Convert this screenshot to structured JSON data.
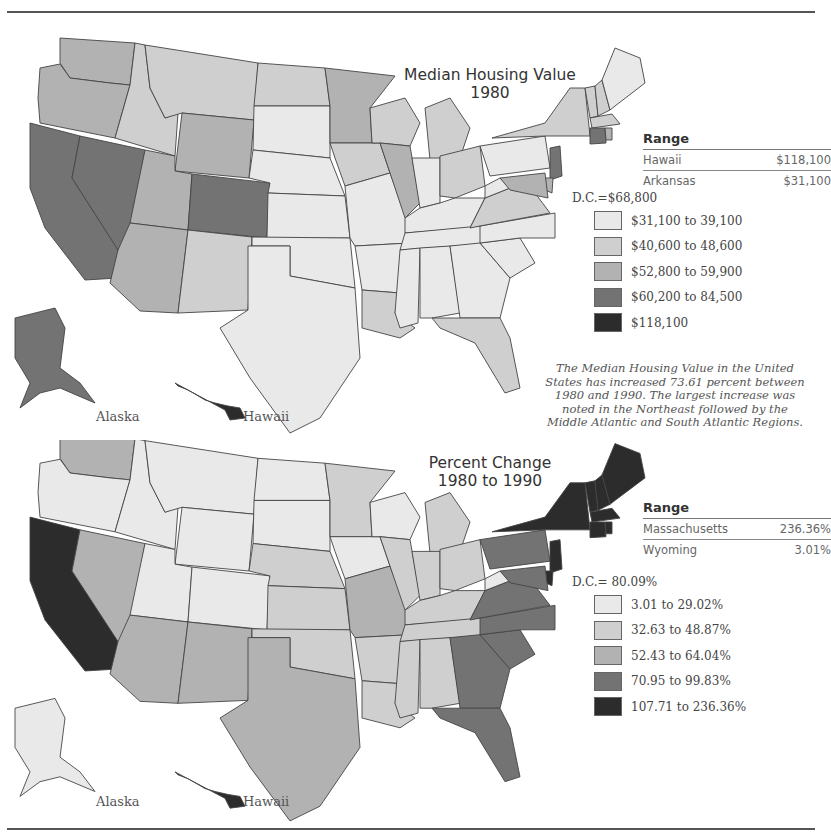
{
  "colors": {
    "c1": "#e9e9e9",
    "c2": "#cfcfcf",
    "c3": "#b2b2b2",
    "c4": "#737373",
    "c5": "#2c2c2c",
    "border": "#444444"
  },
  "map1": {
    "title_line1": "Median Housing Value",
    "title_line2": "1980",
    "range": {
      "header": "Range",
      "rows": [
        {
          "name": "Hawaii",
          "value": "$118,100"
        },
        {
          "name": "Arkansas",
          "value": "$31,100"
        }
      ]
    },
    "dc": "D.C.=$68,800",
    "legend": [
      {
        "label": "$31,100 to 39,100",
        "class": "c1"
      },
      {
        "label": "$40,600 to 48,600",
        "class": "c2"
      },
      {
        "label": "$52,800 to 59,900",
        "class": "c3"
      },
      {
        "label": "$60,200 to 84,500",
        "class": "c4"
      },
      {
        "label": "$118,100",
        "class": "c5"
      }
    ],
    "note": "The Median Housing Value in the United States has increased 73.61 percent between 1980 and 1990. The largest increase was noted in the Northeast followed by the Middle Atlantic and South Atlantic Regions.",
    "alaska_label": "Alaska",
    "hawaii_label": "Hawaii"
  },
  "map2": {
    "title_line1": "Percent Change",
    "title_line2": "1980 to 1990",
    "range": {
      "header": "Range",
      "rows": [
        {
          "name": "Massachusetts",
          "value": "236.36%"
        },
        {
          "name": "Wyoming",
          "value": "3.01%"
        }
      ]
    },
    "dc": "D.C.= 80.09%",
    "legend": [
      {
        "label": "3.01 to 29.02%",
        "class": "c1"
      },
      {
        "label": "32.63 to 48.87%",
        "class": "c2"
      },
      {
        "label": "52.43 to 64.04%",
        "class": "c3"
      },
      {
        "label": "70.95 to 99.83%",
        "class": "c4"
      },
      {
        "label": "107.71 to 236.36%",
        "class": "c5"
      }
    ],
    "alaska_label": "Alaska",
    "hawaii_label": "Hawaii"
  },
  "states_1980": {
    "WA": "c3",
    "OR": "c3",
    "CA": "c4",
    "NV": "c4",
    "ID": "c2",
    "MT": "c2",
    "WY": "c3",
    "UT": "c3",
    "CO": "c4",
    "AZ": "c3",
    "NM": "c2",
    "ND": "c2",
    "SD": "c1",
    "NE": "c1",
    "KS": "c1",
    "OK": "c1",
    "TX": "c1",
    "MN": "c3",
    "IA": "c2",
    "MO": "c1",
    "AR": "c1",
    "LA": "c2",
    "WI": "c2",
    "IL": "c3",
    "MI": "c2",
    "IN": "c1",
    "OH": "c2",
    "KY": "c1",
    "TN": "c1",
    "MS": "c1",
    "AL": "c1",
    "GA": "c1",
    "FL": "c2",
    "SC": "c1",
    "NC": "c1",
    "VA": "c2",
    "WV": "c1",
    "PA": "c1",
    "NY": "c2",
    "VT": "c2",
    "NH": "c2",
    "ME": "c1",
    "MA": "c2",
    "CT": "c4",
    "RI": "c3",
    "NJ": "c4",
    "DE": "c3",
    "MD": "c3",
    "AK": "c4",
    "HI": "c5"
  },
  "states_change": {
    "WA": "c3",
    "OR": "c1",
    "CA": "c5",
    "NV": "c3",
    "ID": "c1",
    "MT": "c1",
    "WY": "c1",
    "UT": "c1",
    "CO": "c1",
    "AZ": "c3",
    "NM": "c3",
    "ND": "c1",
    "SD": "c1",
    "NE": "c2",
    "KS": "c2",
    "OK": "c2",
    "TX": "c3",
    "MN": "c2",
    "IA": "c1",
    "MO": "c3",
    "AR": "c2",
    "LA": "c2",
    "WI": "c1",
    "IL": "c2",
    "MI": "c2",
    "IN": "c2",
    "OH": "c2",
    "KY": "c2",
    "TN": "c2",
    "MS": "c2",
    "AL": "c2",
    "GA": "c4",
    "FL": "c4",
    "SC": "c4",
    "NC": "c4",
    "VA": "c4",
    "WV": "c1",
    "PA": "c4",
    "NY": "c5",
    "VT": "c5",
    "NH": "c5",
    "ME": "c5",
    "MA": "c5",
    "CT": "c5",
    "RI": "c5",
    "NJ": "c5",
    "DE": "c5",
    "MD": "c4",
    "AK": "c1",
    "HI": "c5"
  }
}
